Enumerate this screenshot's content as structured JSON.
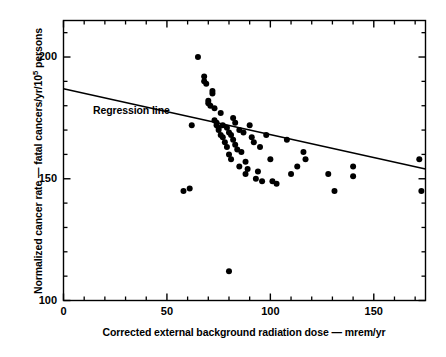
{
  "chart_data": {
    "type": "scatter",
    "title": "",
    "xlabel": "Corrected external background radiation dose — mrem/yr",
    "ylabel_text": "Normalized cancer rate — fatal cancers/yr/10",
    "ylabel_sup": "5",
    "ylabel_tail": " persons",
    "xlim": [
      0,
      175
    ],
    "ylim": [
      100,
      215
    ],
    "xticks_major": [
      0,
      50,
      100,
      150
    ],
    "xtick_labels": [
      "0",
      "50",
      "100",
      "150"
    ],
    "xticks_minor": [
      10,
      20,
      30,
      40,
      60,
      70,
      80,
      90,
      110,
      120,
      130,
      140,
      160,
      170
    ],
    "yticks_major": [
      100,
      150,
      200
    ],
    "ytick_labels": [
      "100",
      "150",
      "200"
    ],
    "yticks_minor": [
      110,
      120,
      130,
      140,
      160,
      170,
      180,
      190,
      210
    ],
    "grid": false,
    "legend": "none",
    "annotations": [
      {
        "name": "regression-line-label",
        "text": "Regression line",
        "x": 14,
        "y": 183
      }
    ],
    "series": [
      {
        "name": "Regression line",
        "type": "line",
        "x": [
          0,
          175
        ],
        "y": [
          187,
          154
        ]
      },
      {
        "name": "Observations",
        "type": "scatter",
        "marker": "filled-circle",
        "color": "#000000",
        "points": [
          [
            61,
            146
          ],
          [
            58,
            145
          ],
          [
            62,
            172
          ],
          [
            65,
            200
          ],
          [
            68,
            192
          ],
          [
            68,
            190
          ],
          [
            69,
            189
          ],
          [
            70,
            182
          ],
          [
            70,
            181
          ],
          [
            71,
            180
          ],
          [
            72,
            186
          ],
          [
            72,
            185
          ],
          [
            73,
            179
          ],
          [
            73,
            174
          ],
          [
            74,
            173
          ],
          [
            74,
            172
          ],
          [
            75,
            171
          ],
          [
            75,
            170
          ],
          [
            76,
            177
          ],
          [
            76,
            168
          ],
          [
            77,
            172
          ],
          [
            77,
            167
          ],
          [
            78,
            165
          ],
          [
            79,
            171
          ],
          [
            79,
            163
          ],
          [
            80,
            169
          ],
          [
            80,
            160
          ],
          [
            81,
            168
          ],
          [
            81,
            158
          ],
          [
            82,
            175
          ],
          [
            82,
            166
          ],
          [
            83,
            173
          ],
          [
            83,
            164
          ],
          [
            84,
            162
          ],
          [
            85,
            170
          ],
          [
            85,
            155
          ],
          [
            86,
            161
          ],
          [
            87,
            169
          ],
          [
            88,
            157
          ],
          [
            88,
            152
          ],
          [
            89,
            154
          ],
          [
            90,
            172
          ],
          [
            91,
            167
          ],
          [
            92,
            165
          ],
          [
            93,
            150
          ],
          [
            94,
            153
          ],
          [
            95,
            163
          ],
          [
            96,
            149
          ],
          [
            98,
            168
          ],
          [
            100,
            158
          ],
          [
            101,
            149
          ],
          [
            103,
            148
          ],
          [
            108,
            166
          ],
          [
            110,
            152
          ],
          [
            113,
            155
          ],
          [
            116,
            161
          ],
          [
            117,
            158
          ],
          [
            128,
            152
          ],
          [
            131,
            145
          ],
          [
            140,
            151
          ],
          [
            140,
            155
          ],
          [
            172,
            158
          ],
          [
            173,
            145
          ],
          [
            80,
            112
          ]
        ]
      }
    ]
  }
}
